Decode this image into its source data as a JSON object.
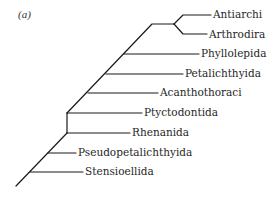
{
  "figure": {
    "panel_label": "(a)",
    "type": "cladogram",
    "line_color": "#1a1a1a",
    "text_color": "#1f1f1f"
  },
  "taxa": [
    {
      "name": "Antiarchi",
      "label_x": 213,
      "y": 15,
      "line_from_x": 183
    },
    {
      "name": "Arthrodira",
      "label_x": 209,
      "y": 34,
      "line_from_x": 183
    },
    {
      "name": "Phyllolepida",
      "label_x": 201,
      "y": 54,
      "line_from_x": 124
    },
    {
      "name": "Petalichthyida",
      "label_x": 185,
      "y": 74,
      "line_from_x": 106
    },
    {
      "name": "Acanthothoraci",
      "label_x": 160,
      "y": 93,
      "line_from_x": 88
    },
    {
      "name": "Ptyctodontida",
      "label_x": 144,
      "y": 113,
      "line_from_x": 67
    },
    {
      "name": "Rhenanida",
      "label_x": 132,
      "y": 133,
      "line_from_x": 67
    },
    {
      "name": "Pseudopetalichthyida",
      "label_x": 78,
      "y": 153,
      "line_from_x": 48
    },
    {
      "name": "Stensioellida",
      "label_x": 85,
      "y": 172,
      "line_from_x": 30
    }
  ]
}
